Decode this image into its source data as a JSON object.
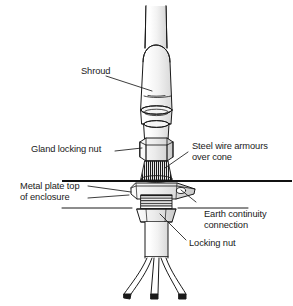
{
  "figure": {
    "background_color": "#ffffff",
    "line_color": "#1a1a1a",
    "shade_color": "#d9d9d9"
  },
  "labels": {
    "shroud": "Shroud",
    "gland_locking_nut": "Gland locking nut",
    "steel_wire_armours_line1": "Steel wire armours",
    "steel_wire_armours_line2": "over cone",
    "metal_plate_line1": "Metal plate top",
    "metal_plate_line2": "of enclosure",
    "earth_continuity_line1": "Earth continuity",
    "earth_continuity_line2": "connection",
    "locking_nut": "Locking nut"
  },
  "parts": {
    "cable": "cable",
    "shroud_body": "shroud",
    "gland_body": "gland-body",
    "hex_nut": "gland-locking-nut",
    "armour_cone": "steel-wire-armour-cone",
    "enclosure_plate": "metal-plate-top-of-enclosure",
    "earth_tag": "earth-continuity-tag",
    "threaded_shank": "threaded-shank",
    "locking_nut_part": "locking-nut",
    "conductors": "three-conductors"
  }
}
